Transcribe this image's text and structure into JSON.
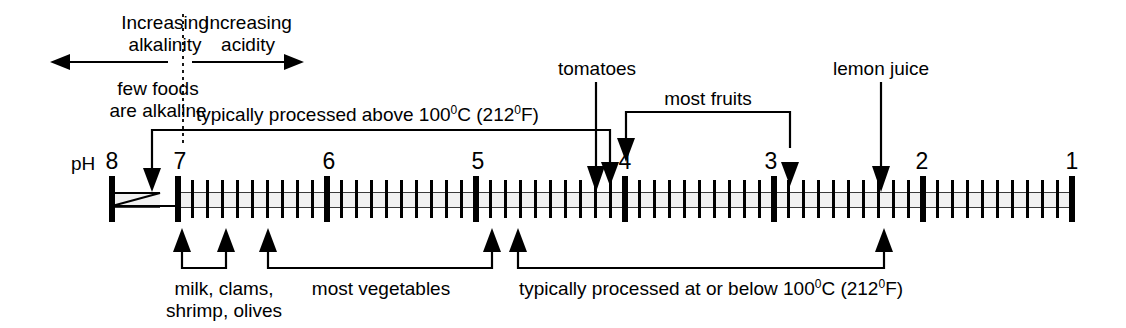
{
  "diagram": {
    "axis_label": "pH",
    "direction_labels": {
      "left_line1": "Increasing",
      "left_line2": "alkalinity",
      "left_note1": "few foods",
      "left_note2": "are alkaline",
      "right_line1": "Increasing",
      "right_line2": "acidity"
    },
    "scale": {
      "ticks": [
        {
          "label": "8",
          "value": 8
        },
        {
          "label": "7",
          "value": 7
        },
        {
          "label": "6",
          "value": 6
        },
        {
          "label": "5",
          "value": 5
        },
        {
          "label": "4",
          "value": 4
        },
        {
          "label": "3",
          "value": 3
        },
        {
          "label": "2",
          "value": 2
        },
        {
          "label": "1",
          "value": 1
        }
      ],
      "minor_ticks_per_unit": 10,
      "break_between": [
        8,
        7
      ]
    },
    "annotations_above": [
      {
        "id": "processed-above",
        "text_prefix": "typically processed above 100",
        "text_deg1": "0",
        "text_mid": "C (212",
        "text_deg2": "0",
        "text_suffix": "F)",
        "full_text": "typically processed above 100°C (212°F)",
        "span_ph": [
          7.05,
          4.12
        ],
        "kind": "bracket-both-ends-down"
      },
      {
        "id": "tomatoes",
        "full_text": "tomatoes",
        "point_ph": 4.2,
        "kind": "single-arrow-down"
      },
      {
        "id": "most-fruits",
        "full_text": "most fruits",
        "span_ph": [
          4.0,
          2.9
        ],
        "kind": "bracket-both-ends-down"
      },
      {
        "id": "lemon-juice",
        "full_text": "lemon juice",
        "point_ph": 2.3,
        "kind": "single-arrow-down"
      }
    ],
    "annotations_below": [
      {
        "id": "milk-clams-shrimp-olives",
        "line1": "milk, clams,",
        "line2": "shrimp, olives",
        "full_text": "milk, clams, shrimp, olives",
        "span_ph": [
          6.98,
          6.68
        ],
        "kind": "bracket-both-ends-up"
      },
      {
        "id": "most-vegetables",
        "full_text": "most vegetables",
        "span_ph": [
          6.4,
          4.9
        ],
        "kind": "bracket-both-ends-up"
      },
      {
        "id": "processed-at-or-below",
        "text_prefix": "typically processed at or below 100",
        "text_deg1": "0",
        "text_mid": "C (212",
        "text_deg2": "0",
        "text_suffix": "F)",
        "full_text": "typically processed at or below 100°C (212°F)",
        "span_ph": [
          4.73,
          2.28
        ],
        "kind": "bracket-both-ends-up"
      }
    ],
    "colors": {
      "ink": "#000000",
      "band_fill": "#f1f1f1",
      "band_edge": "#3a3a3a",
      "background": "#ffffff"
    }
  }
}
